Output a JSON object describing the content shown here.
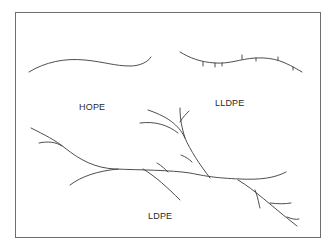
{
  "diagram": {
    "type": "polymer chain structures",
    "labels": {
      "hdpe": "HOPE",
      "lldpe": "LLDPE",
      "ldpe": "LDPE"
    },
    "line_color": "#3a3a3a",
    "border_color": "#6e6e6e"
  }
}
